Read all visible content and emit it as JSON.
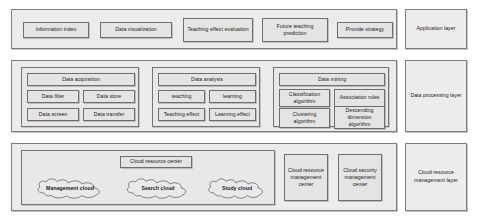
{
  "diagram": {
    "colors": {
      "panel_fill": "#ececec",
      "node_fill": "#e4e4e4",
      "border": "#7d7d7d",
      "text": "#1a1a1a"
    }
  },
  "layers": [
    {
      "id": "application",
      "tag_label": "Application layer",
      "nodes": [
        {
          "label": "Information index"
        },
        {
          "label": "Data visualization"
        },
        {
          "label": "Teaching effect evaluation"
        },
        {
          "label": "Future teaching prediction"
        },
        {
          "label": "Provide strategy"
        }
      ]
    },
    {
      "id": "data-processing",
      "tag_label": "Data processing layer",
      "groups": [
        {
          "id": "data-acquisition",
          "head": "Data acquisition",
          "cells": [
            "Data filter",
            "Data store",
            "Data screen",
            "Data transfer"
          ]
        },
        {
          "id": "data-analysis",
          "head": "Data analysis",
          "cells": [
            "teaching",
            "learning",
            "Teaching effect",
            "Learning effect"
          ]
        },
        {
          "id": "data-mining",
          "head": "Data mining",
          "cells": [
            "Classification algorithm",
            "Association rules",
            "Clustering algorithm",
            "Descending dimension algorithm"
          ]
        }
      ]
    },
    {
      "id": "cloud-resource-management",
      "tag_label": "Cloud resource management layer",
      "center_panel": {
        "head": "Cloud resource center",
        "clouds": [
          {
            "label": "Management cloud"
          },
          {
            "label": "Search cloud"
          },
          {
            "label": "Study cloud"
          }
        ]
      },
      "centers": [
        {
          "label": "Cloud resource management center"
        },
        {
          "label": "Cloud security management center"
        }
      ]
    }
  ]
}
